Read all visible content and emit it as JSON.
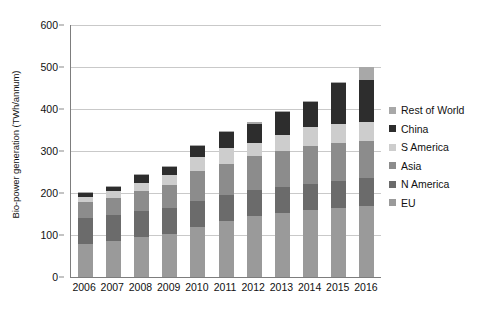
{
  "chart_data": {
    "type": "bar",
    "subtype": "stacked-vertical",
    "title": "",
    "xlabel": "",
    "ylabel": "Bio-power generation (TWh/annum)",
    "ylim": [
      0,
      600
    ],
    "ytick_step": 100,
    "yticks": [
      "0",
      "100",
      "200",
      "300",
      "400",
      "500",
      "600"
    ],
    "grid": "horizontal",
    "legend_position": "right",
    "legend_order_top_to_bottom": [
      "Rest of World",
      "China",
      "S America",
      "Asia",
      "N America",
      "EU"
    ],
    "stack_order_bottom_to_top": [
      "EU",
      "N America",
      "Asia",
      "S America",
      "China",
      "Rest of World"
    ],
    "categories": [
      "2006",
      "2007",
      "2008",
      "2009",
      "2010",
      "2011",
      "2012",
      "2013",
      "2014",
      "2015",
      "2016"
    ],
    "series": [
      {
        "name": "EU",
        "color": "#9a9a9a",
        "values": [
          78,
          85,
          95,
          103,
          120,
          133,
          145,
          152,
          160,
          165,
          170
        ]
      },
      {
        "name": "N America",
        "color": "#6b6b6b",
        "values": [
          62,
          62,
          62,
          62,
          62,
          62,
          62,
          62,
          62,
          63,
          65
        ]
      },
      {
        "name": "Asia",
        "color": "#8c8c8c",
        "values": [
          38,
          42,
          48,
          55,
          70,
          75,
          80,
          85,
          90,
          90,
          90
        ]
      },
      {
        "name": "S America",
        "color": "#cdcdcd",
        "values": [
          13,
          15,
          18,
          22,
          33,
          38,
          33,
          40,
          45,
          47,
          45
        ]
      },
      {
        "name": "China",
        "color": "#2d2d2d",
        "values": [
          8,
          11,
          19,
          20,
          27,
          37,
          45,
          53,
          60,
          97,
          100
        ]
      },
      {
        "name": "Rest of World",
        "color": "#a8a8a8",
        "values": [
          3,
          3,
          3,
          3,
          3,
          3,
          3,
          3,
          3,
          3,
          30
        ]
      }
    ],
    "totals": [
      202,
      218,
      245,
      265,
      315,
      348,
      368,
      395,
      420,
      465,
      500
    ]
  },
  "axis": {
    "y_title": "Bio-power generation (TWh/annum)"
  }
}
